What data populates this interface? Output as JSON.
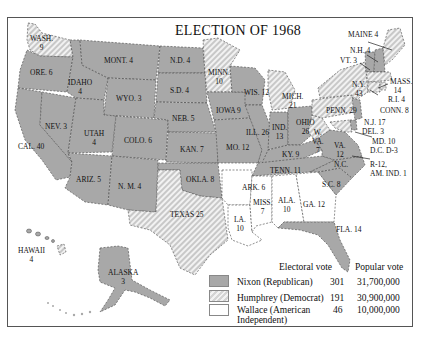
{
  "title": "ELECTION OF 1968",
  "legend": {
    "electoral_header": "Electoral vote",
    "popular_header": "Popular vote",
    "entries": [
      {
        "name": "Nixon (Republican)",
        "electoral": "301",
        "popular": "31,700,000",
        "pattern": "solid-gray",
        "color": "#a8a8a8"
      },
      {
        "name": "Humphrey (Democrat)",
        "electoral": "191",
        "popular": "30,900,000",
        "pattern": "diagonal-hatch",
        "color": "#d4d4d4"
      },
      {
        "name": "Wallace (American Independent)",
        "name_line1": "Wallace (American",
        "name_line2": "Independent)",
        "electoral": "46",
        "popular": "10,000,000",
        "pattern": "white",
        "color": "#ffffff"
      }
    ]
  },
  "states": {
    "wash": {
      "abbr": "WASH.",
      "votes": "9",
      "winner": "Humphrey"
    },
    "ore": {
      "label": "ORE. 6",
      "winner": "Nixon"
    },
    "cal": {
      "label": "CAL. 40",
      "winner": "Nixon"
    },
    "idaho": {
      "abbr": "IDAHO",
      "votes": "4",
      "winner": "Nixon"
    },
    "nev": {
      "label": "NEV. 3",
      "winner": "Nixon"
    },
    "mont": {
      "label": "MONT. 4",
      "winner": "Nixon"
    },
    "wyo": {
      "label": "WYO. 3",
      "winner": "Nixon"
    },
    "utah": {
      "abbr": "UTAH",
      "votes": "4",
      "winner": "Nixon"
    },
    "colo": {
      "label": "COLO. 6",
      "winner": "Nixon"
    },
    "ariz": {
      "label": "ARIZ. 5",
      "winner": "Nixon"
    },
    "nm": {
      "label": "N. M. 4",
      "winner": "Nixon"
    },
    "nd": {
      "label": "N.D. 4",
      "winner": "Nixon"
    },
    "sd": {
      "label": "S.D. 4",
      "winner": "Nixon"
    },
    "neb": {
      "label": "NEB. 5",
      "winner": "Nixon"
    },
    "kan": {
      "label": "KAN. 7",
      "winner": "Nixon"
    },
    "okla": {
      "label": "OKLA. 8",
      "winner": "Nixon"
    },
    "texas": {
      "label": "TEXAS 25",
      "winner": "Humphrey"
    },
    "minn": {
      "abbr": "MINN.",
      "votes": "10",
      "winner": "Humphrey"
    },
    "iowa": {
      "label": "IOWA 9",
      "winner": "Nixon"
    },
    "mo": {
      "label": "MO. 12",
      "winner": "Nixon"
    },
    "ark": {
      "label": "ARK. 6",
      "winner": "Wallace"
    },
    "la": {
      "abbr": "LA.",
      "votes": "10",
      "winner": "Wallace"
    },
    "wis": {
      "label": "WIS. 12",
      "winner": "Nixon"
    },
    "ill": {
      "label": "ILL. 26",
      "winner": "Nixon"
    },
    "mich": {
      "abbr": "MICH.",
      "votes": "21",
      "winner": "Humphrey"
    },
    "ind": {
      "abbr": "IND.",
      "votes": "13",
      "winner": "Nixon"
    },
    "ohio": {
      "abbr": "OHIO",
      "votes": "26",
      "winner": "Nixon"
    },
    "ky": {
      "label": "KY. 9",
      "winner": "Nixon"
    },
    "tenn": {
      "label": "TENN. 11",
      "winner": "Nixon"
    },
    "miss": {
      "abbr": "MISS.",
      "votes": "7",
      "winner": "Wallace"
    },
    "ala": {
      "abbr": "ALA.",
      "votes": "10",
      "winner": "Wallace"
    },
    "ga": {
      "label": "GA. 12",
      "winner": "Wallace"
    },
    "fla": {
      "label": "FLA. 14",
      "winner": "Nixon"
    },
    "sc": {
      "label": "S.C. 8",
      "winner": "Nixon"
    },
    "nc": {
      "label": "N.C.",
      "winner": "Nixon"
    },
    "nc_note": {
      "line1": "R-12,",
      "line2": "AM. IND. 1"
    },
    "va": {
      "abbr": "VA.",
      "votes": "12",
      "winner": "Nixon"
    },
    "wva": {
      "abbr": "W.",
      "abbr2": "VA.",
      "votes": "7",
      "winner": "Humphrey"
    },
    "penn": {
      "label": "PENN. 29",
      "winner": "Humphrey"
    },
    "ny": {
      "abbr": "N.Y.",
      "votes": "43",
      "winner": "Humphrey"
    },
    "maine": {
      "label": "MAINE 4",
      "winner": "Humphrey"
    },
    "nh": {
      "label": "N.H. 4",
      "winner": "Nixon"
    },
    "vt": {
      "label": "VT. 3",
      "winner": "Nixon"
    },
    "mass": {
      "abbr": "MASS.",
      "votes": "14",
      "winner": "Humphrey"
    },
    "ri": {
      "label": "R.I. 4",
      "winner": "Humphrey"
    },
    "conn": {
      "label": "CONN. 8",
      "winner": "Humphrey"
    },
    "nj": {
      "label": "N.J. 17",
      "winner": "Nixon"
    },
    "del": {
      "label": "DEL. 3",
      "winner": "Nixon"
    },
    "md": {
      "label": "MD. 10",
      "winner": "Humphrey"
    },
    "dc": {
      "label": "D.C. D-3",
      "winner": "Humphrey"
    },
    "hawaii": {
      "abbr": "HAWAII",
      "votes": "4",
      "winner": "Humphrey"
    },
    "alaska": {
      "abbr": "ALASKA",
      "votes": "3",
      "winner": "Nixon"
    }
  }
}
